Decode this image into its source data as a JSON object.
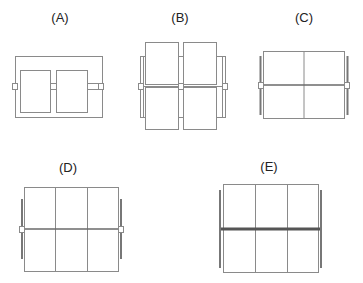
{
  "figure": {
    "panels": [
      {
        "id": "A",
        "label": "(A)",
        "description": "Two panels inside an outer frame with hinge clips at left, center, right"
      },
      {
        "id": "B",
        "label": "(B)",
        "description": "2x2 panels overlapping a background frame, hinge clips at mid-height"
      },
      {
        "id": "C",
        "label": "(C)",
        "description": "2x2 panel grid with side rails and hinge clips at mid-height"
      },
      {
        "id": "D",
        "label": "(D)",
        "description": "3x2 panel grid with side rails and hinge clips at mid-height"
      },
      {
        "id": "E",
        "label": "(E)",
        "description": "3x2 panel grid with thick horizontal center bar and side rails"
      }
    ],
    "colors": {
      "line": "#8a8a8a",
      "dark_line": "#555555",
      "background": "#ffffff"
    }
  }
}
